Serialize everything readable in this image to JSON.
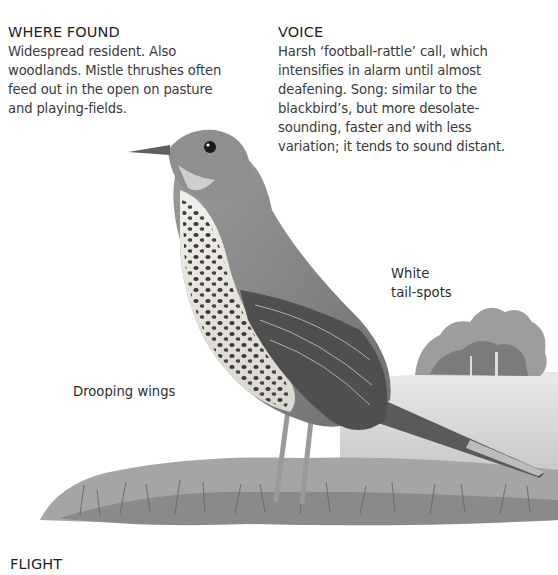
{
  "where_found": {
    "heading": "WHERE FOUND",
    "lines": [
      "Widespread resident. Also",
      "woodlands. Mistle thrushes often",
      "feed out in the open on pasture",
      "and playing-fields."
    ]
  },
  "voice": {
    "heading": "VOICE",
    "lines": [
      "Harsh ‘football-rattle’ call, which",
      "intensifies in alarm until almost",
      "deafening. Song: similar to the",
      "blackbird’s, but more desolate-",
      "sounding, faster and with less",
      "variation; it tends to sound distant."
    ]
  },
  "annotations": {
    "tail_label_line1": "White",
    "tail_label_line2": "tail-spots",
    "wing_label": "Drooping wings"
  },
  "flight": {
    "heading": "FLIGHT"
  },
  "illustration": {
    "subject": "mistle-thrush-illustration",
    "palette": {
      "plumage": "#8a8a8a",
      "breast": "#e8e6e0",
      "spots": "#3c3c3c",
      "grass": "#9a9a9a",
      "trees": "#7e7e7e"
    }
  }
}
